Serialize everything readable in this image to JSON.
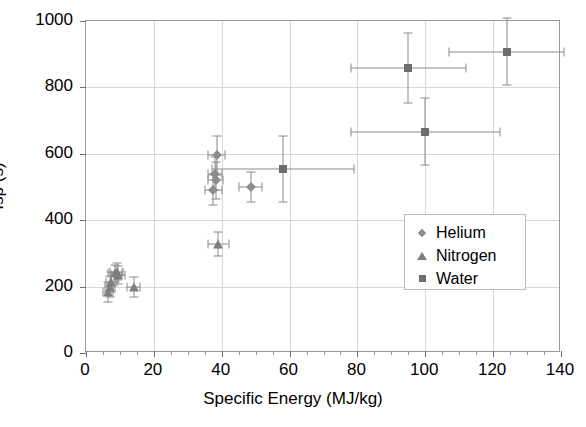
{
  "chart_data": {
    "type": "scatter",
    "title": "",
    "xlabel": "Specific Energy (MJ/kg)",
    "ylabel": "Isp (s)",
    "xlim": [
      0,
      140
    ],
    "ylim": [
      0,
      1000
    ],
    "xticks": [
      0,
      20,
      40,
      60,
      80,
      100,
      120,
      140
    ],
    "yticks": [
      0,
      200,
      400,
      600,
      800,
      1000
    ],
    "grid": true,
    "legend_position": "middle-right",
    "error_bars": true,
    "series": [
      {
        "name": "Helium",
        "marker": "diamond",
        "color": "#8c8c8c",
        "points": [
          {
            "x": 38.5,
            "y": 595,
            "xerr": 2.5,
            "yerr": 60
          },
          {
            "x": 38.0,
            "y": 540,
            "xerr": 2.0,
            "yerr": 50
          },
          {
            "x": 38.2,
            "y": 520,
            "xerr": 2.2,
            "yerr": 55
          },
          {
            "x": 37.5,
            "y": 490,
            "xerr": 2.5,
            "yerr": 45
          },
          {
            "x": 48.5,
            "y": 500,
            "xerr": 3.5,
            "yerr": 45
          }
        ]
      },
      {
        "name": "Nitrogen",
        "marker": "triangle",
        "color": "#7d7d7d",
        "points": [
          {
            "x": 6.5,
            "y": 185,
            "xerr": 1.5,
            "yerr": 30
          },
          {
            "x": 7.0,
            "y": 200,
            "xerr": 1.5,
            "yerr": 32
          },
          {
            "x": 7.5,
            "y": 215,
            "xerr": 1.5,
            "yerr": 30
          },
          {
            "x": 8.5,
            "y": 240,
            "xerr": 2.0,
            "yerr": 25
          },
          {
            "x": 9.0,
            "y": 245,
            "xerr": 2.0,
            "yerr": 25
          },
          {
            "x": 9.5,
            "y": 235,
            "xerr": 2.0,
            "yerr": 28
          },
          {
            "x": 14.0,
            "y": 200,
            "xerr": 2.0,
            "yerr": 30
          },
          {
            "x": 39.0,
            "y": 328,
            "xerr": 3.0,
            "yerr": 35
          }
        ]
      },
      {
        "name": "Water",
        "marker": "square",
        "color": "#6d6d6d",
        "points": [
          {
            "x": 58.0,
            "y": 555,
            "xerr": 21.0,
            "yerr": 100
          },
          {
            "x": 95.0,
            "y": 858,
            "xerr": 17.0,
            "yerr": 105
          },
          {
            "x": 100.0,
            "y": 667,
            "xerr": 22.0,
            "yerr": 100
          },
          {
            "x": 124.0,
            "y": 908,
            "xerr": 17.0,
            "yerr": 100
          }
        ]
      }
    ]
  },
  "axes": {
    "x_title": "Specific Energy (MJ/kg)",
    "y_title": "Isp (s)",
    "x_tick_labels": [
      "0",
      "20",
      "40",
      "60",
      "80",
      "100",
      "120",
      "140"
    ],
    "y_tick_labels": [
      "0",
      "200",
      "400",
      "600",
      "800",
      "1000"
    ]
  },
  "legend": {
    "entries": [
      {
        "label": "Helium",
        "marker": "diamond-icon"
      },
      {
        "label": "Nitrogen",
        "marker": "triangle-icon"
      },
      {
        "label": "Water",
        "marker": "square-icon"
      }
    ]
  },
  "colors": {
    "helium": "#8c8c8c",
    "nitrogen": "#7d7d7d",
    "water": "#6d6d6d",
    "grid": "#d8d8d8",
    "axis": "#9a9a9a",
    "background": "#ffffff"
  }
}
